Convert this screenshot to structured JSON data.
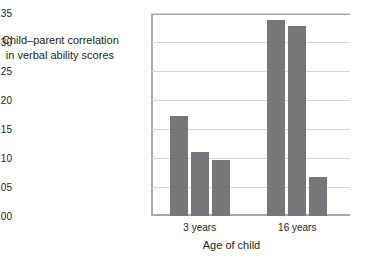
{
  "chart_data": {
    "type": "bar",
    "title": "",
    "subtitle": "",
    "xlabel": "Age of child",
    "ylabel": "Child–parent correlation in verbal ability scores",
    "ylabel_lines": [
      "Child–parent correlation",
      "in verbal ability scores"
    ],
    "categories": [
      "3 years",
      "16 years"
    ],
    "series": [
      {
        "name": "bar-1",
        "values": [
          0.173,
          0.338
        ]
      },
      {
        "name": "bar-2",
        "values": [
          0.111,
          0.327
        ]
      },
      {
        "name": "bar-3",
        "values": [
          0.096,
          0.067
        ]
      }
    ],
    "bars_flat": [
      {
        "group": "3 years",
        "index": 1,
        "value": 0.173
      },
      {
        "group": "3 years",
        "index": 2,
        "value": 0.111
      },
      {
        "group": "3 years",
        "index": 3,
        "value": 0.096
      },
      {
        "group": "16 years",
        "index": 1,
        "value": 0.338
      },
      {
        "group": "16 years",
        "index": 2,
        "value": 0.327
      },
      {
        "group": "16 years",
        "index": 3,
        "value": 0.067
      }
    ],
    "ylim": [
      0.0,
      0.35
    ],
    "ytick_values": [
      0.0,
      0.05,
      0.1,
      0.15,
      0.2,
      0.25,
      0.3,
      0.35
    ],
    "ytick_labels": [
      ".00",
      ".05",
      ".10",
      ".15",
      ".20",
      ".25",
      ".30",
      ".35"
    ],
    "grid": true,
    "legend": "none",
    "colors": {
      "bar_fill": "#77777a",
      "gridline": "#d6d7d9",
      "axis": "#a7a9ac",
      "text": "#231f20",
      "background": "#ffffff"
    }
  }
}
